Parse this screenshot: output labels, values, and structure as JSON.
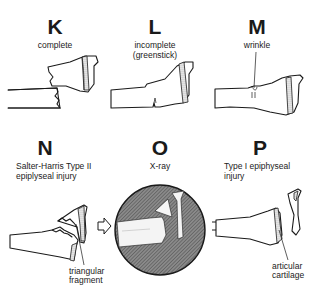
{
  "diagram": {
    "panels": [
      {
        "letter": "K",
        "caption": "complete"
      },
      {
        "letter": "L",
        "caption_line1": "incomplete",
        "caption_line2": "(greenstick)"
      },
      {
        "letter": "M",
        "caption": "wrinkle"
      },
      {
        "letter": "N",
        "caption_line1": "Salter-Harris Type II",
        "caption_line2": "epiplyseal injury",
        "annotation_line1": "triangular",
        "annotation_line2": "fragment"
      },
      {
        "letter": "O",
        "caption": "X-ray"
      },
      {
        "letter": "P",
        "caption_line1": "Type I epiphyseal",
        "caption_line2": "injury",
        "annotation_line1": "articular",
        "annotation_line2": "cartilage"
      }
    ],
    "arrows": [
      {
        "from": "N",
        "to": "O",
        "style": "outline-arrow"
      },
      {
        "from": "O",
        "to": "P",
        "style": "equals-lines"
      }
    ],
    "colors": {
      "line": "#1a1a1a",
      "xray_fill": "#7a7a7a",
      "background": "#ffffff"
    }
  }
}
